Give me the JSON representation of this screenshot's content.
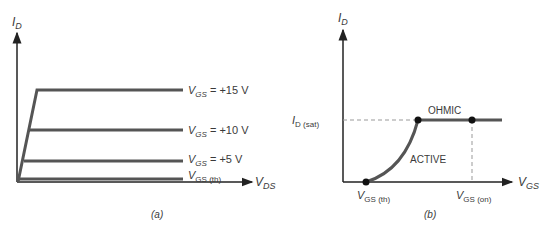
{
  "panel_a": {
    "caption": "(a)",
    "y_axis": {
      "main": "I",
      "sub": "D"
    },
    "x_axis": {
      "main": "V",
      "sub": "DS"
    },
    "curves": [
      {
        "main": "V",
        "sub": "GS",
        "suffix": " = +15 V"
      },
      {
        "main": "V",
        "sub": "GS",
        "suffix": " = +10 V"
      },
      {
        "main": "V",
        "sub": "GS",
        "suffix": " = +5 V"
      },
      {
        "main": "V",
        "sub": "GS (th)",
        "suffix": ""
      }
    ]
  },
  "panel_b": {
    "caption": "(b)",
    "y_axis": {
      "main": "I",
      "sub": "D"
    },
    "x_axis": {
      "main": "V",
      "sub": "GS"
    },
    "y_marker": {
      "main": "I",
      "sub": "D (sat)"
    },
    "x_markers": [
      {
        "main": "V",
        "sub": "GS (th)"
      },
      {
        "main": "V",
        "sub": "GS (on)"
      }
    ],
    "regions": {
      "ohmic": "OHMIC",
      "active": "ACTIVE"
    }
  },
  "colors": {
    "line": "#555555",
    "axis": "#222222",
    "dash": "#999999"
  }
}
